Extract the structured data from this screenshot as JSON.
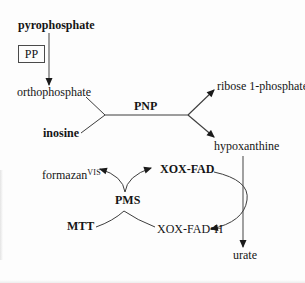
{
  "colors": {
    "background": "#fdfdfd",
    "line": "#3d3d3d",
    "arrowhead": "#1a1a1a",
    "text": "#151515",
    "box_border": "#4a4a4a"
  },
  "labels": {
    "pyrophosphate": "pyrophosphate",
    "pp_box": "PP",
    "orthophosphate": "orthophosphate",
    "inosine": "inosine",
    "pnp": "PNP",
    "ribose_1_phosphate": "ribose 1-phosphate",
    "hypoxanthine": "hypoxanthine",
    "urate": "urate",
    "xox_fad": "XOX-FAD",
    "xox_fad_h": "XOX-FAD•H",
    "formazan_base": "formazan",
    "formazan_superscript": "VIS",
    "pms": "PMS",
    "mtt": "MTT"
  }
}
